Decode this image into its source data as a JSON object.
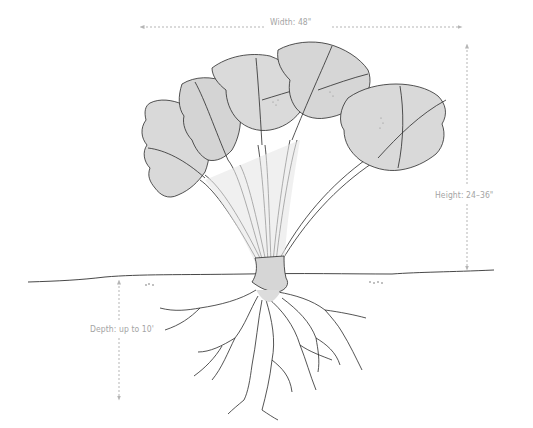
{
  "diagram": {
    "annotations": {
      "width": "Width: 48\"",
      "height": "Height: 24–36\"",
      "depth": "Depth: up to 10'"
    },
    "colors": {
      "ink": "#2a2a2a",
      "leaf_fill": "#d9d9d9",
      "dimension_line": "#b5b5b5",
      "label_text": "#a4a4a4",
      "background": "#ffffff"
    }
  }
}
